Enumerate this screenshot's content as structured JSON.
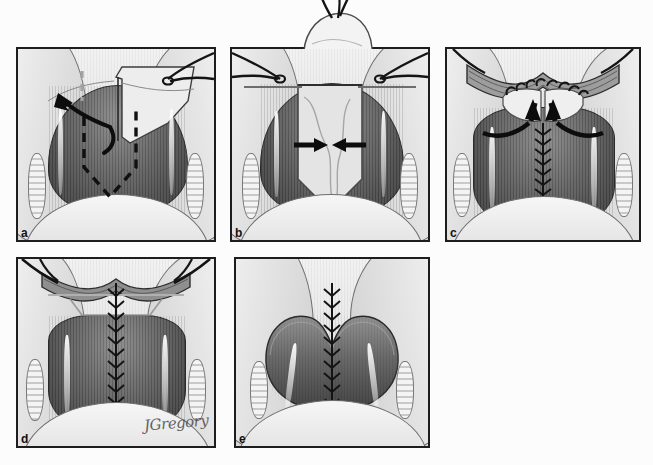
{
  "figure": {
    "modality": "grayscale medical line-and-tone illustration",
    "background_color": "#fcfcfc",
    "ink_color": "#141414",
    "panel_border_color": "#1d1d1d",
    "panel_count": 5,
    "artist_signature": "JGregory"
  },
  "panels": [
    {
      "id": "a",
      "label": "a",
      "caption": "Planned incision outlined; flap elevated and reflected laterally",
      "annotations": {
        "dashed_incision": "black dashed V-shaped incision outline",
        "midline_guide": "gray dashed vertical midline reference",
        "arrow": "curved arrow directed superolaterally indicating flap reflection"
      },
      "arrow_count": 1,
      "suture_count": 2
    },
    {
      "id": "b",
      "label": "b",
      "caption": "Graft seated into the defect; opposing arrows show approximation",
      "annotations": {
        "graft": "bulky tissue graft extending above the field",
        "arrows": "two horizontal arrows converging on the midline"
      },
      "arrow_count": 2,
      "suture_count": 2
    },
    {
      "id": "c",
      "label": "c",
      "caption": "Interrupted sutures placed anteriorly; flaps advanced medially",
      "annotations": {
        "arrows": "two oblique arrows converging toward the midline",
        "sutures": "interrupted stitches across the anterior margin",
        "running_suture": "midline running closure extending inferiorly"
      },
      "arrow_count": 2,
      "suture_count": 2
    },
    {
      "id": "d",
      "label": "d",
      "caption": "Completed midline closure with retracting stay sutures in place",
      "annotations": {
        "running_suture": "continuous midline suture line",
        "stay_sutures": "bilateral stay sutures on the anterior margin"
      },
      "arrow_count": 0,
      "suture_count": 2
    },
    {
      "id": "e",
      "label": "e",
      "caption": "Final appearance after release of retraction",
      "annotations": {
        "running_suture": "healed midline suture line without retraction"
      },
      "arrow_count": 0,
      "suture_count": 0
    }
  ],
  "layout": {
    "rows": 2,
    "row_one_panels": [
      "a",
      "b",
      "c"
    ],
    "row_two_panels": [
      "d",
      "e"
    ],
    "image_width": 653,
    "image_height": 465
  }
}
